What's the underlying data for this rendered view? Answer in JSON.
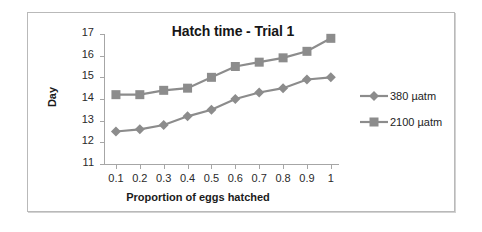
{
  "chart_data": {
    "type": "line",
    "title": "Hatch time - Trial 1",
    "xlabel": "Proportion of eggs hatched",
    "ylabel": "Day",
    "x": [
      0.1,
      0.2,
      0.3,
      0.4,
      0.5,
      0.6,
      0.7,
      0.8,
      0.9,
      1
    ],
    "xtick_labels": [
      "0.1",
      "0.2",
      "0.3",
      "0.4",
      "0.5",
      "0.6",
      "0.7",
      "0.8",
      "0.9",
      "1"
    ],
    "ytick_labels": [
      "17",
      "16",
      "15",
      "14",
      "13",
      "12",
      "11"
    ],
    "ylim": [
      11,
      17
    ],
    "xlim": [
      0.05,
      1.03
    ],
    "grid": false,
    "legend_position": "right",
    "series": [
      {
        "name": "380 µatm",
        "marker": "diamond",
        "color": "#8c8c8c",
        "values": [
          12.5,
          12.6,
          12.8,
          13.2,
          13.5,
          14.0,
          14.3,
          14.5,
          14.9,
          15.0
        ]
      },
      {
        "name": "2100 µatm",
        "marker": "square",
        "color": "#8c8c8c",
        "values": [
          14.2,
          14.2,
          14.4,
          14.5,
          15.0,
          15.5,
          15.7,
          15.9,
          16.2,
          16.8
        ]
      }
    ]
  },
  "legend": {
    "entries": [
      {
        "label": "380 µatm"
      },
      {
        "label": "2100 µatm"
      }
    ]
  },
  "colors": {
    "series": "#8c8c8c",
    "axis": "#a6a6a6",
    "text": "#1b1b1b",
    "frame": "#b9b9b9"
  }
}
